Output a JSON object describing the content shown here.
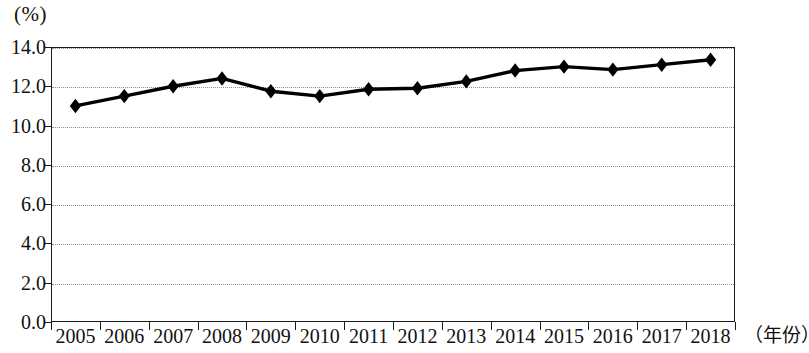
{
  "chart_data": {
    "type": "line",
    "title": "(%)",
    "xlabel": "（年份）",
    "ylabel": "(%)",
    "categories": [
      "2005",
      "2006",
      "2007",
      "2008",
      "2009",
      "2010",
      "2011",
      "2012",
      "2013",
      "2014",
      "2015",
      "2016",
      "2017",
      "2018"
    ],
    "values": [
      11.0,
      11.5,
      12.0,
      12.4,
      11.75,
      11.5,
      11.85,
      11.9,
      12.25,
      12.8,
      13.0,
      12.85,
      13.1,
      13.35
    ],
    "series": [
      {
        "name": "",
        "values": [
          11.0,
          11.5,
          12.0,
          12.4,
          11.75,
          11.5,
          11.85,
          11.9,
          12.25,
          12.8,
          13.0,
          12.85,
          13.1,
          13.35
        ]
      }
    ],
    "ylim": [
      0.0,
      14.0
    ],
    "ytick_labels": [
      "0.0",
      "2.0",
      "4.0",
      "6.0",
      "8.0",
      "10.0",
      "12.0",
      "14.0"
    ],
    "ytick_values": [
      0.0,
      2.0,
      4.0,
      6.0,
      8.0,
      10.0,
      12.0,
      14.0
    ],
    "grid": true,
    "grid_axis": "y",
    "grid_style": "dotted",
    "legend": false,
    "legend_position": "none",
    "marker": "diamond",
    "line_color": "#000000",
    "marker_color": "#000000",
    "grid_color": "#8d8d8d",
    "axis_color": "#1a1a1a",
    "background_color": "#ffffff"
  }
}
